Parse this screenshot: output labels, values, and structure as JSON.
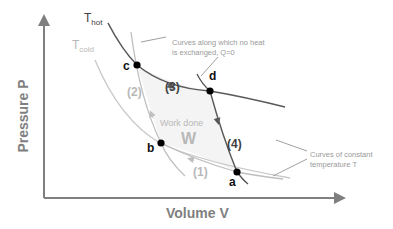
{
  "diagram": {
    "type": "PV diagram (Carnot cycle)",
    "axes": {
      "y_label": "Pressure P",
      "x_label": "Volume V"
    },
    "isotherms": {
      "hot_label_main": "T",
      "hot_label_sub": "hot",
      "cold_label_main": "T",
      "cold_label_sub": "cold"
    },
    "points": {
      "a": "a",
      "b": "b",
      "c": "c",
      "d": "d"
    },
    "steps": {
      "s1": "(1)",
      "s2": "(2)",
      "s3": "(3)",
      "s4": "(4)"
    },
    "work": {
      "label": "Work done",
      "symbol": "W"
    },
    "annotations": {
      "adiabat_note_line1": "Curves along which no heat",
      "adiabat_note_line2": "is exchanged, Q=0",
      "isotherm_note_line1": "Curves of constant",
      "isotherm_note_line2": "temperature T"
    },
    "colors": {
      "hot_curve": "#595959",
      "cold_curve": "#bfbfbf",
      "axis": "#7f7f7f",
      "points": "#000000"
    }
  }
}
